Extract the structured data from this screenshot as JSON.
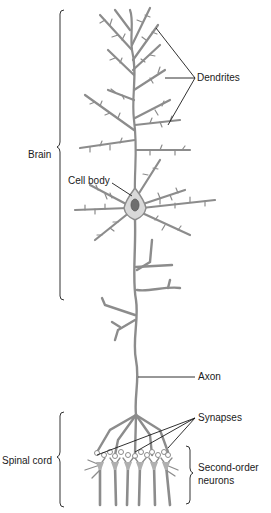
{
  "diagram": {
    "colors": {
      "neuron": "#8c8c8c",
      "neuron_fill": "#d9d9d9",
      "nucleus": "#6e6e6e",
      "leader": "#1a1a1a",
      "text": "#1a1a1a",
      "background": "#ffffff"
    },
    "labels": {
      "dendrites": "Dendrites",
      "brain": "Brain",
      "cell_body": "Cell body",
      "axon": "Axon",
      "synapses": "Synapses",
      "spinal_cord": "Spinal cord",
      "second_order_line1": "Second-order",
      "second_order_line2": "neurons"
    }
  }
}
